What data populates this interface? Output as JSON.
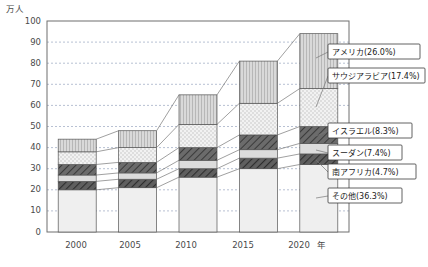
{
  "chart_data": {
    "type": "bar",
    "subtype": "stacked-bar",
    "title": "",
    "xlabel": "年",
    "ylabel": "万人",
    "ylim": [
      0,
      100
    ],
    "ytick_step": 10,
    "yticks": [
      "0",
      "10",
      "20",
      "30",
      "40",
      "50",
      "60",
      "70",
      "80",
      "90",
      "100"
    ],
    "categories": [
      "2000",
      "2005",
      "2010",
      "2015",
      "2020"
    ],
    "grid": true,
    "legend_position": "right-inline-labels",
    "stack_order_bottom_to_top": [
      "その他",
      "南アフリカ",
      "スーダン",
      "イスラエル",
      "サウジアラビア",
      "アメリカ"
    ],
    "series": [
      {
        "name": "その他",
        "label": "その他 (36.3%)",
        "percent": 36.3,
        "values": [
          20,
          21,
          26,
          30,
          32
        ]
      },
      {
        "name": "南アフリカ",
        "label": "南アフリカ (4.7%)",
        "percent": 4.7,
        "values": [
          4,
          4,
          4,
          5,
          5
        ]
      },
      {
        "name": "スーダン",
        "label": "スーダン (7.4%)",
        "percent": 7.4,
        "values": [
          3,
          3,
          4,
          4,
          5
        ]
      },
      {
        "name": "イスラエル",
        "label": "イスラエル (8.3%)",
        "percent": 8.3,
        "values": [
          5,
          5,
          6,
          7,
          8
        ]
      },
      {
        "name": "サウジアラビア",
        "label": "サウジアラビア (17.4%)",
        "percent": 17.4,
        "values": [
          6,
          7,
          11,
          15,
          18
        ]
      },
      {
        "name": "アメリカ",
        "label": "アメリカ (26.0%)",
        "percent": 26.0,
        "values": [
          6,
          8,
          14,
          20,
          26
        ]
      }
    ],
    "totals": [
      44,
      48,
      65,
      81,
      94
    ]
  },
  "axes": {
    "unit_top_left": "万人",
    "x_axis_name": "年"
  },
  "legend": {
    "items": [
      {
        "key": "america",
        "text": "アメリカ(26.0%)"
      },
      {
        "key": "saudi",
        "text": "サウジアラビア(17.4%)"
      },
      {
        "key": "israel",
        "text": "イスラエル(8.3%)"
      },
      {
        "key": "sudan",
        "text": "スーダン(7.4%)"
      },
      {
        "key": "southafrica",
        "text": "南アフリカ(4.7%)"
      },
      {
        "key": "other",
        "text": "その他(36.3%)"
      }
    ]
  },
  "colors": {
    "frame": "#6f6f6f",
    "grid": "#9aa6c0",
    "text": "#4a4a4a",
    "america_fill": "#d5d5d5",
    "saudi_fill": "#ececec",
    "israel_fill": "#7b7b7b",
    "sudan_fill": "#d9d9d9",
    "southafrica_fill": "#6e6e6e",
    "other_fill": "#eeeeee"
  }
}
